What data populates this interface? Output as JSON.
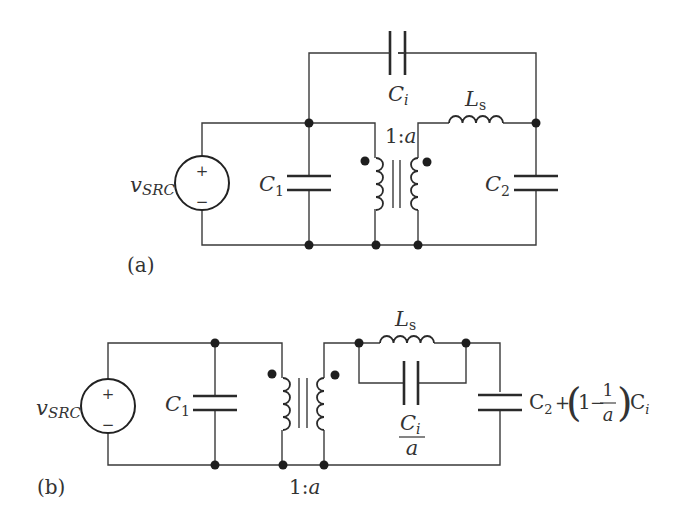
{
  "diagram_a": {
    "panel_label": "(a)",
    "source_label_main": "v",
    "source_label_sub": "SRC",
    "source_plus": "+",
    "source_minus": "−",
    "c1_main": "C",
    "c1_sub": "1",
    "c2_main": "C",
    "c2_sub": "2",
    "ci_main": "C",
    "ci_sub": "i",
    "ls_main": "L",
    "ls_sub": "s",
    "transformer_ratio_prefix": "1:",
    "transformer_ratio_var": "a"
  },
  "diagram_b": {
    "panel_label": "(b)",
    "source_label_main": "v",
    "source_label_sub": "SRC",
    "source_plus": "+",
    "source_minus": "−",
    "c1_main": "C",
    "c1_sub": "1",
    "ls_main": "L",
    "ls_sub": "s",
    "ci_over_a_num_main": "C",
    "ci_over_a_num_sub": "i",
    "ci_over_a_den": "a",
    "c2_expr_c2_main": "C",
    "c2_expr_c2_sub": "2",
    "c2_expr_plus": "+",
    "c2_expr_one": "1",
    "c2_expr_minus": "−",
    "c2_expr_frac_num": "1",
    "c2_expr_frac_den": "a",
    "c2_expr_ci_main": "C",
    "c2_expr_ci_sub": "i",
    "transformer_ratio_prefix": "1:",
    "transformer_ratio_var": "a"
  }
}
